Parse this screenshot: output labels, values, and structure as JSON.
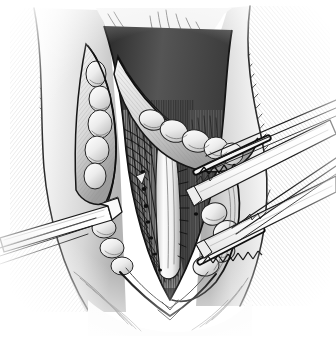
{
  "image": {
    "domain": "Diagram",
    "kind": "medical-surgical-illustration",
    "technique": "pen-and-ink stipple and hatch line drawing",
    "title": "Surgical exposure of the operative field with retractors",
    "width_px": 336,
    "height_px": 338,
    "background_color": "#ffffff",
    "ink_color": "#1a1a1a",
    "midtone_color": "#8d8d8d",
    "light_tissue_color": "#e8e8e8",
    "shadow_color": "#3a3a3a",
    "has_visible_text": false,
    "caption": ""
  },
  "scene": {
    "view": "Anterior operative view of a vertical midline incision held open by retractors",
    "orientation": "Patient head toward top of image, feet toward bottom",
    "illumination": "Light from upper left; deep wound interior in shadow"
  },
  "regions": [
    {
      "id": "body-left-flank",
      "label": "Left body wall / skin and muscle surface",
      "description": "Broad curved tissue surface at left, rendered with long parallel diagonal hatch strokes following the body contour",
      "tone": "light-to-mid grey",
      "hatch_direction": "upper-left to lower-right diagonal curved"
    },
    {
      "id": "body-right-flank",
      "label": "Right body wall / skin and muscle surface",
      "description": "Broad curved tissue surface at right with dense diagonal hatching converging to the body contour edge",
      "tone": "light-to-mid grey",
      "hatch_direction": "upper-right to lower-left diagonal curved"
    },
    {
      "id": "wound-incision",
      "label": "Vertical surgical incision",
      "description": "Elongated diamond/teardrop shaped opening running from the superior apex at top center to the pointed inferior apex at bottom center",
      "tone": "dark interior with bright exposed structures"
    },
    {
      "id": "wound-apex-superior",
      "label": "Superior apex of incision",
      "description": "Narrow pointed top of the wound where the fascial flaps meet"
    },
    {
      "id": "wound-apex-inferior",
      "label": "Inferior apex of incision",
      "description": "V-shaped pointed bottom of the wound, outlined with a heavy dark contour line"
    },
    {
      "id": "fascial-flap-left",
      "label": "Left fascial / subcutaneous flap",
      "description": "Reflected flap of tissue on the left side of the wound with a bold dark free edge"
    },
    {
      "id": "fascial-flap-right",
      "label": "Right fascial / subcutaneous flap",
      "description": "Reflected flap of tissue curving across the upper right of the wound with a bold dark free edge"
    },
    {
      "id": "fat-lobules-left",
      "label": "Left fatty / lobular tissue mass",
      "description": "Pale rounded lobulated tissue mass (fat and nodes) sitting along the left wound margin"
    },
    {
      "id": "fat-lobules-upper-right",
      "label": "Upper right fat lobules and lymph nodes",
      "description": "Chain of pale bulbous lobules running along the upper right wound margin"
    },
    {
      "id": "fat-lobules-lower-right",
      "label": "Lower right fat lobules",
      "description": "Cluster of pale rounded lobules in the lower right of the wound bed"
    },
    {
      "id": "central-vessel",
      "label": "Central vessel / neurovascular bundle",
      "description": "Pale vertical tubular structure running down the centre of the wound, highlighted against the shaded wound floor",
      "tone": "bright highlight with fine cross-hatch shading"
    },
    {
      "id": "muscle-fibers",
      "label": "Striated muscle belly",
      "description": "Vertically striated muscle fibres exposed in the wound floor to the left of the central vessel"
    },
    {
      "id": "deep-shadow",
      "label": "Deep wound shadow",
      "description": "Dark shaded crevice between the retracted flaps and the wound floor"
    },
    {
      "id": "vessel-stumps",
      "label": "Ligated vessel stumps",
      "description": "Series of small dark dots/ticks marking divided and ligated small vessels along the wound floor"
    }
  ],
  "instruments": [
    {
      "id": "retractor-left",
      "name": "Left hand-held retractor blade",
      "type": "flat blade retractor",
      "entry": "Enters from the left edge of the image",
      "angle_deg": -18,
      "tip": "Bent hooked tip engaging the left wound margin",
      "surface": "white with thin parallel outline strokes",
      "teeth": false
    },
    {
      "id": "retractor-right-upper",
      "name": "Upper right toothed retractor blade",
      "type": "toothed self-retaining retractor blade",
      "entry": "Enters from the upper right edge of the image",
      "angle_deg": 26,
      "tip": "Serrated toothed edge gripping the right wound margin",
      "surface": "white with long parallel shaft lines",
      "teeth": true
    },
    {
      "id": "retractor-right-lower",
      "name": "Lower right toothed retractor blade",
      "type": "toothed self-retaining retractor blade",
      "entry": "Enters from the right edge of the image below the upper blade",
      "angle_deg": 22,
      "tip": "Serrated toothed edge gripping the lower right wound margin",
      "surface": "white with long parallel shaft lines",
      "teeth": true
    }
  ],
  "toothed_edges": [
    {
      "id": "teeth-band-upper",
      "label": "Upper toothed gripping band",
      "pattern": "alternating dark triangular teeth forming a diamond chain",
      "tooth_count": 14
    },
    {
      "id": "teeth-band-lower",
      "label": "Lower toothed gripping band",
      "pattern": "alternating dark triangular teeth forming a diamond chain",
      "tooth_count": 12
    }
  ],
  "palette": {
    "paper": "#ffffff",
    "ink": "#1a1a1a",
    "ink_soft": "#4a4a4a",
    "hatch": "#6e6e6e",
    "hatch_light": "#a8a8a8",
    "tissue_light": "#ededed",
    "tissue_mid": "#c9c9c9",
    "tissue_dark": "#7c7c7c",
    "shadow_deep": "#2b2b2b",
    "metal_white": "#fbfbfb",
    "metal_edge": "#2a2a2a"
  }
}
